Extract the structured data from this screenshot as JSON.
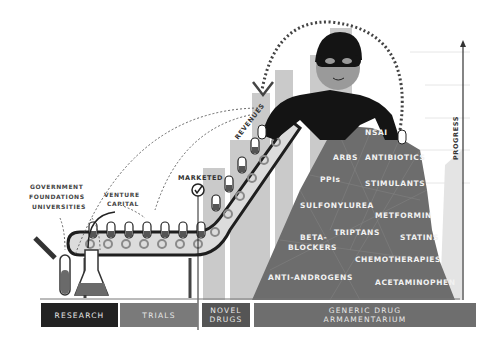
{
  "diagram": {
    "funding_sources": {
      "public": [
        "GOVERNMENT",
        "FOUNDATIONS",
        "UNIVERSITIES"
      ],
      "private": [
        "VENTURE",
        "CAPITAL"
      ]
    },
    "labels": {
      "marketed": "MARKETED",
      "revenues": "REVENUES",
      "progress": "PROGRESS"
    },
    "stages": [
      {
        "id": "research",
        "label": "RESEARCH",
        "color": "#222222"
      },
      {
        "id": "trials",
        "label": "TRIALS",
        "color": "#7a7a7a"
      },
      {
        "id": "novel-drugs",
        "label_line1": "NOVEL",
        "label_line2": "DRUGS",
        "color": "#555555"
      },
      {
        "id": "generic",
        "label_line1": "GENERIC DRUG",
        "label_line2": "ARMAMENTARIUM",
        "color": "#6e6e6e"
      }
    ],
    "generic_drug_classes": [
      "NSAI",
      "ARBS",
      "ANTIBIOTICS",
      "PPIs",
      "STIMULANTS",
      "SULFONYLUREA",
      "METFORMIN",
      "BETA-",
      "BLOCKERS",
      "TRIPTANS",
      "STATINS",
      "CHEMOTHERAPIES",
      "ANTI-ANDROGENS",
      "ACETAMINOPHEN"
    ],
    "colors": {
      "mountain": "#6b6b6b",
      "bars": "#c8c8c8",
      "thief": "#111111",
      "face": "#9a9a9a",
      "conveyor": "#dcdcdc"
    }
  }
}
